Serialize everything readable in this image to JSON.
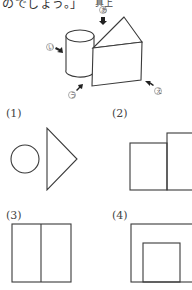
{
  "header": {
    "text": "のでしょう。」",
    "direction_label": "真上"
  },
  "solid_figure": {
    "description": "cylinder combined with triangular prism",
    "view_markers": [
      {
        "id": "a",
        "label": "あ",
        "direction": "from above"
      },
      {
        "id": "i",
        "label": "い",
        "direction": "from left"
      },
      {
        "id": "u",
        "label": "う",
        "direction": "from front-left"
      },
      {
        "id": "e",
        "label": "え",
        "direction": "from front-right"
      }
    ]
  },
  "problems": [
    {
      "label": "(1)",
      "shape": "circle beside triangle"
    },
    {
      "label": "(2)",
      "shape": "two adjacent rectangles, right one taller"
    },
    {
      "label": "(3)",
      "shape": "square divided by vertical line"
    },
    {
      "label": "(4)",
      "shape": "square with inner rectangle on bottom edge"
    }
  ]
}
